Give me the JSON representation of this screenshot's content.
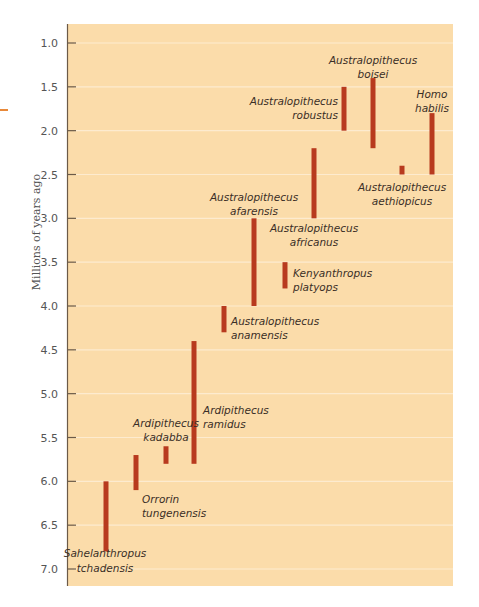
{
  "chart_data": {
    "type": "range-bar",
    "title": "",
    "xlabel": "",
    "ylabel": "Millions of years ago",
    "ylim": [
      0.8,
      7.2
    ],
    "y_inverted": true,
    "grid": true,
    "y_ticks": [
      "1.0",
      "1.5",
      "2.0",
      "2.5",
      "3.0",
      "3.5",
      "4.0",
      "4.5",
      "5.0",
      "5.5",
      "6.0",
      "6.5",
      "7.0"
    ],
    "series": [
      {
        "name": "Sahelanthropus tchadensis",
        "label_lines": [
          "Sahelanthropus",
          "tchadensis"
        ],
        "start": 6.0,
        "end": 6.8
      },
      {
        "name": "Orrorin tungenensis",
        "label_lines": [
          "Orrorin",
          "tungenensis"
        ],
        "start": 5.7,
        "end": 6.1
      },
      {
        "name": "Ardipithecus kadabba",
        "label_lines": [
          "Ardipithecus",
          "kadabba"
        ],
        "start": 5.6,
        "end": 5.8
      },
      {
        "name": "Ardipithecus ramidus",
        "label_lines": [
          "Ardipithecus",
          "ramidus"
        ],
        "start": 4.4,
        "end": 5.8
      },
      {
        "name": "Australopithecus anamensis",
        "label_lines": [
          "Australopithecus",
          "anamensis"
        ],
        "start": 4.0,
        "end": 4.3
      },
      {
        "name": "Australopithecus afarensis",
        "label_lines": [
          "Australopithecus",
          "afarensis"
        ],
        "start": 3.0,
        "end": 4.0
      },
      {
        "name": "Kenyanthropus platyops",
        "label_lines": [
          "Kenyanthropus",
          "platyops"
        ],
        "start": 3.5,
        "end": 3.8
      },
      {
        "name": "Australopithecus africanus",
        "label_lines": [
          "Australopithecus",
          "africanus"
        ],
        "start": 2.2,
        "end": 3.0
      },
      {
        "name": "Australopithecus robustus",
        "label_lines": [
          "Australopithecus",
          "robustus"
        ],
        "start": 1.5,
        "end": 2.0
      },
      {
        "name": "Australopithecus boisei",
        "label_lines": [
          "Australopithecus",
          "boisei"
        ],
        "start": 1.4,
        "end": 2.2
      },
      {
        "name": "Australopithecus aethiopicus",
        "label_lines": [
          "Australopithecus",
          "aethiopicus"
        ],
        "start": 2.4,
        "end": 2.5
      },
      {
        "name": "Homo habilis",
        "label_lines": [
          "Homo",
          "habilis"
        ],
        "start": 1.8,
        "end": 2.5
      }
    ]
  },
  "colors": {
    "background": "#fbdcaa",
    "bar": "#b83a1e",
    "gridline": "#fdebcf",
    "axis": "#6b5a48",
    "tick_label": "#555555",
    "species_label": "#3a2e26"
  }
}
